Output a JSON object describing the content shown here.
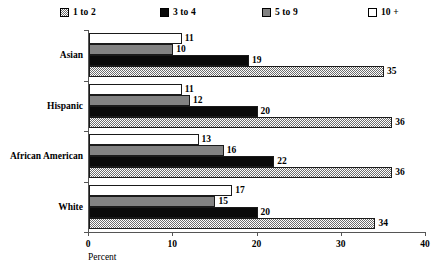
{
  "chart_data": {
    "type": "bar",
    "orientation": "horizontal",
    "title": "",
    "xlabel": "Percent",
    "ylabel": "",
    "xlim": [
      0,
      40
    ],
    "xticks": [
      0,
      10,
      20,
      30,
      40
    ],
    "grid": false,
    "legend_position": "top",
    "categories": [
      "Asian",
      "Hispanic",
      "African American",
      "White"
    ],
    "series": [
      {
        "name": "1 to 2",
        "swatch": "checker",
        "values": [
          35,
          36,
          36,
          34
        ]
      },
      {
        "name": "3 to 4",
        "swatch": "black",
        "values": [
          19,
          20,
          22,
          20
        ]
      },
      {
        "name": "5 to 9",
        "swatch": "gray",
        "values": [
          10,
          12,
          16,
          15
        ]
      },
      {
        "name": "10 +",
        "swatch": "white",
        "values": [
          11,
          11,
          13,
          17
        ]
      }
    ]
  },
  "legend": {
    "items": [
      {
        "label": "1 to 2",
        "swatch": "checker"
      },
      {
        "label": "3 to 4",
        "swatch": "black"
      },
      {
        "label": "5 to 9",
        "swatch": "gray"
      },
      {
        "label": "10 +",
        "swatch": "white"
      }
    ]
  },
  "axis": {
    "x_title": "Percent",
    "tick_labels": [
      "0",
      "10",
      "20",
      "30",
      "40"
    ]
  },
  "colors": {
    "checker_dark": "#6e6e6e",
    "black": "#0a0a0a",
    "gray": "#828282",
    "white": "#ffffff",
    "axis": "#555555",
    "text": "#000000"
  }
}
